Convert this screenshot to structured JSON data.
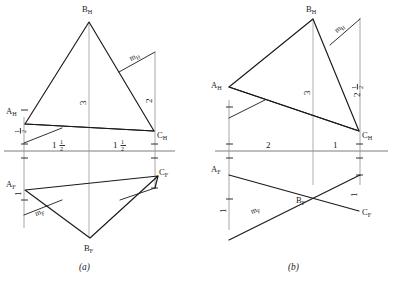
{
  "figure": {
    "type": "orthographic-projection-drawing",
    "background_color": "#ffffff",
    "line_color": "#1a1a1a",
    "reference_line_color": "#6e6e6e",
    "extension_line_color": "#8f8f8f",
    "panels": [
      {
        "id": "a",
        "caption": "(a)",
        "top_view": {
          "vertices": [
            {
              "name": "B_H",
              "base": "B",
              "sub": "H"
            },
            {
              "name": "A_H",
              "base": "A",
              "sub": "H"
            },
            {
              "name": "C_H",
              "base": "C",
              "sub": "H"
            }
          ],
          "median_label": {
            "base": "m",
            "sub": "H"
          },
          "dim_center": "3",
          "dim_right": "2",
          "dim_left_upper": "1/2",
          "dim_left_lower": "1/2",
          "dim_right_upper": "1/2"
        },
        "front_view": {
          "vertices": [
            {
              "name": "A_F",
              "base": "A",
              "sub": "F"
            },
            {
              "name": "B_F",
              "base": "B",
              "sub": "F"
            },
            {
              "name": "C_F",
              "base": "C",
              "sub": "F"
            }
          ],
          "median_label": {
            "base": "m",
            "sub": "F"
          },
          "dim_left_upper": "1",
          "dim_left_lower": "1/2",
          "dim_right_upper": "1/2",
          "dim_right_lower": "1/2"
        },
        "ground_dimensions": [
          {
            "whole": "1",
            "num": "1",
            "den": "2"
          },
          {
            "whole": "1",
            "num": "1",
            "den": "2"
          }
        ]
      },
      {
        "id": "b",
        "caption": "(b)",
        "top_view": {
          "vertices": [
            {
              "name": "B_H",
              "base": "B",
              "sub": "H"
            },
            {
              "name": "A_H",
              "base": "A",
              "sub": "H"
            },
            {
              "name": "C_H",
              "base": "C",
              "sub": "H"
            }
          ],
          "median_label": {
            "base": "m",
            "sub": "H"
          },
          "dim_center": "3",
          "dim_right_whole": "2",
          "dim_right_frac_num": "1",
          "dim_right_frac_den": "2",
          "dim_left_upper": "1/2",
          "dim_left_lower": "1/2",
          "dim_right_lower": "1/2"
        },
        "front_view": {
          "vertices": [
            {
              "name": "A_F",
              "base": "A",
              "sub": "F"
            },
            {
              "name": "B_F",
              "base": "B",
              "sub": "F"
            },
            {
              "name": "C_F",
              "base": "C",
              "sub": "F"
            }
          ],
          "median_label": {
            "base": "m",
            "sub": "F"
          },
          "dim_left_upper": "1/2",
          "dim_left_lower_frac": "1/2",
          "dim_left_lower_whole": "1",
          "dim_right_upper": "1/2",
          "dim_right_lower": "1"
        },
        "ground_dimensions": [
          {
            "whole": "2"
          },
          {
            "whole": "1"
          }
        ]
      }
    ]
  }
}
